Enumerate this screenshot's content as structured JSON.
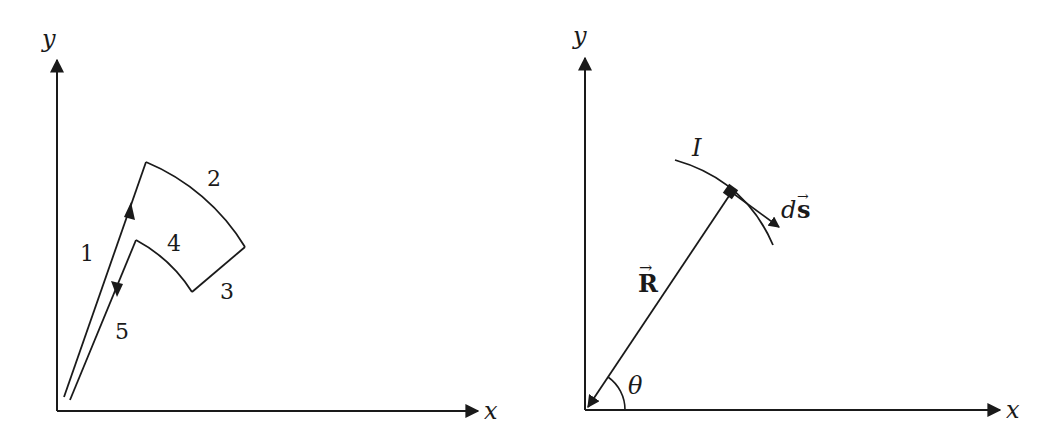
{
  "left_diagram": {
    "axis_y_label": "y",
    "axis_x_label": "x",
    "segment_labels": [
      "1",
      "2",
      "3",
      "4",
      "5"
    ]
  },
  "right_diagram": {
    "axis_y_label": "y",
    "axis_x_label": "x",
    "current_label": "I",
    "position_vector_label": "R",
    "position_vector_arrow": "→",
    "element_label_d": "d",
    "element_label_s": "s",
    "element_label_arrow": "→",
    "angle_label": "θ"
  },
  "colors": {
    "stroke": "#1a1a1a",
    "background": "#ffffff"
  }
}
